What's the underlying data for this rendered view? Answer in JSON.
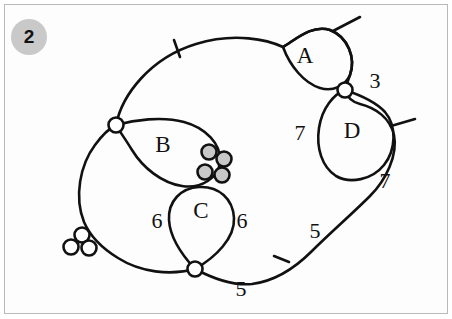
{
  "figure": {
    "badge_number": "2",
    "background_color": "#ffffff",
    "frame_color": "#b9b9b9",
    "stroke_color": "#111111",
    "node_fill_open": "#ffffff",
    "node_fill_shaded": "#c8c8c8",
    "badge_fill": "#c9c9c9"
  },
  "regions": [
    {
      "id": "A",
      "label": "A",
      "x": 305,
      "y": 63
    },
    {
      "id": "B",
      "label": "B",
      "x": 163,
      "y": 152
    },
    {
      "id": "C",
      "label": "C",
      "x": 201,
      "y": 218
    },
    {
      "id": "D",
      "label": "D",
      "x": 352,
      "y": 138
    }
  ],
  "edge_weights": [
    {
      "id": "w-3",
      "value": "3",
      "x": 375,
      "y": 88
    },
    {
      "id": "w-7-left",
      "value": "7",
      "x": 300,
      "y": 140
    },
    {
      "id": "w-7-right",
      "value": "7",
      "x": 385,
      "y": 188
    },
    {
      "id": "w-6-left",
      "value": "6",
      "x": 157,
      "y": 228
    },
    {
      "id": "w-6-right",
      "value": "6",
      "x": 242,
      "y": 228
    },
    {
      "id": "w-5-right",
      "value": "5",
      "x": 315,
      "y": 238
    },
    {
      "id": "w-5-bottom",
      "value": "5",
      "x": 241,
      "y": 296
    }
  ],
  "nodes": [
    {
      "id": "node-b-left",
      "kind": "open",
      "cx": 116,
      "cy": 125,
      "r": 7.5
    },
    {
      "id": "node-ad",
      "kind": "open",
      "cx": 345,
      "cy": 90,
      "r": 7.5
    },
    {
      "id": "node-c-bottom",
      "kind": "open",
      "cx": 195,
      "cy": 269,
      "r": 7.5
    },
    {
      "id": "node-cluster-left-top",
      "kind": "open",
      "cx": 82,
      "cy": 235,
      "r": 7.5
    },
    {
      "id": "node-cluster-left-lower-left",
      "kind": "open",
      "cx": 71,
      "cy": 247,
      "r": 7.5
    },
    {
      "id": "node-cluster-left-lower-right",
      "kind": "open",
      "cx": 89,
      "cy": 248,
      "r": 7.5
    },
    {
      "id": "node-cluster-mid-upper-left",
      "kind": "shaded",
      "cx": 209,
      "cy": 152,
      "r": 7.5
    },
    {
      "id": "node-cluster-mid-upper-right",
      "kind": "shaded",
      "cx": 224,
      "cy": 159,
      "r": 7.5
    },
    {
      "id": "node-cluster-mid-lower-left",
      "kind": "shaded",
      "cx": 205,
      "cy": 172,
      "r": 7.5
    },
    {
      "id": "node-cluster-mid-lower-right",
      "kind": "shaded",
      "cx": 222,
      "cy": 175,
      "r": 7.5
    }
  ],
  "tick_marks": [
    {
      "id": "tick-top",
      "x1": 174,
      "y1": 40,
      "x2": 180,
      "y2": 57
    },
    {
      "id": "tick-bottom-right",
      "x1": 289,
      "y1": 262,
      "x2": 274,
      "y2": 256
    }
  ],
  "branch_strands": [
    {
      "id": "strand-a-top-right",
      "x1": 333,
      "y1": 31,
      "x2": 360,
      "y2": 17
    },
    {
      "id": "strand-d-right",
      "x1": 391,
      "y1": 126,
      "x2": 415,
      "y2": 119
    }
  ],
  "curves": {
    "outer_boundary": "Large irregular closed outer curve enclosing all regions",
    "loop_a": "Teardrop loop labeled A at upper right",
    "loop_b": "Teardrop loop labeled B at center left",
    "loop_c": "Teardrop loop labeled C at lower center",
    "loop_d": "Teardrop loop labeled D at right"
  }
}
